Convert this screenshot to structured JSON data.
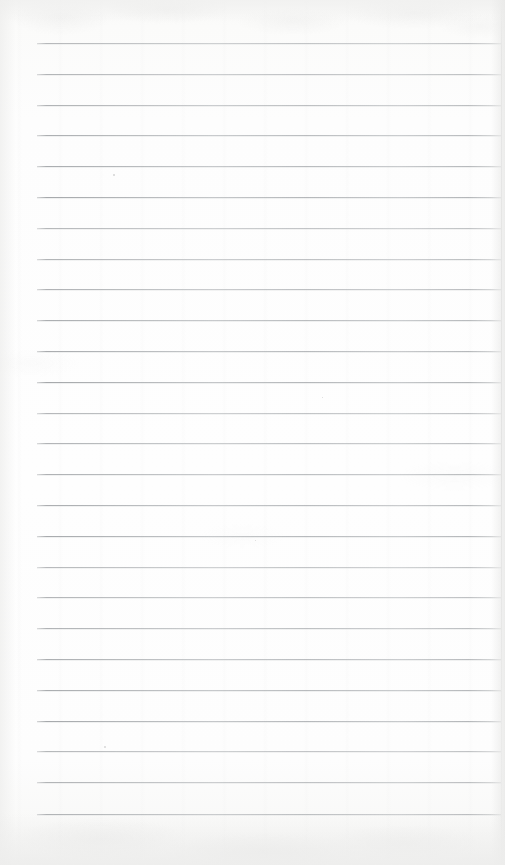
{
  "document": {
    "kind": "scanned-page",
    "title": "Blank Lined Notebook Page",
    "description": "Scan of an empty ruled notebook page. No text, headings, figures or annotations are present.",
    "page_width": 505,
    "page_height": 865,
    "paper_color": "#fdfdfd",
    "rule_color": "#aaadb0",
    "text_content": "",
    "has_text": false,
    "has_images": false,
    "has_tables": false
  },
  "ruling": {
    "line_count": 26,
    "first_line_y": 43,
    "line_spacing": 30.8,
    "line_start_x": 37,
    "line_end_x": 501,
    "line_thickness": 1,
    "left_margin_rule": false,
    "line_positions_y": [
      43,
      74,
      105,
      135,
      166,
      197,
      228,
      259,
      289,
      320,
      351,
      382,
      413,
      443,
      474,
      505,
      536,
      567,
      597,
      628,
      659,
      690,
      721,
      751,
      782,
      814
    ]
  },
  "margins": {
    "top": 43,
    "left": 37,
    "right": 4,
    "bottom": 51
  },
  "artifacts": {
    "specks": [
      {
        "x": 113,
        "y": 174,
        "size": 1.6
      },
      {
        "x": 322,
        "y": 397,
        "size": 1.4
      },
      {
        "x": 104,
        "y": 746,
        "size": 1.8
      },
      {
        "x": 255,
        "y": 540,
        "size": 1.2
      }
    ],
    "edge_shadow_right": true,
    "edge_shadow_bottom": true,
    "paper_texture": "mottled-scan-noise"
  }
}
